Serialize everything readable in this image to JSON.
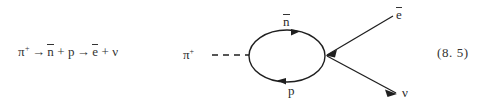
{
  "figure": {
    "background_color": "#ffffff",
    "ink_color": "#2b2b2b",
    "equation_number": "(8. 5)",
    "reaction": {
      "pion": "π",
      "pion_charge": "+",
      "arrow1": "→",
      "antineutron": "n",
      "plus1": "+",
      "proton": "p",
      "arrow2": "→",
      "positron": "e",
      "plus2": "+",
      "neutrino": "ν"
    },
    "diagram": {
      "incoming_label": "π",
      "incoming_charge": "+",
      "loop_top_label": "n",
      "loop_bottom_label": "p",
      "outgoing_top_label": "e",
      "outgoing_bottom_label": "ν",
      "line_color": "#1f1f1f",
      "dashed_line_color": "#1f1f1f"
    }
  }
}
